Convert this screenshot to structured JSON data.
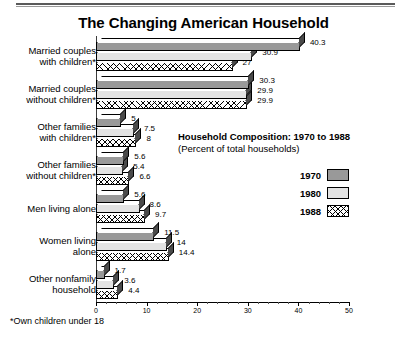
{
  "chart_data": {
    "type": "bar",
    "orientation": "horizontal",
    "title": "The Changing American Household",
    "subtitle_main": "Household Composition: 1970 to 1988",
    "subtitle_sub": "(Percent of total households)",
    "xlabel": "",
    "ylabel": "",
    "xlim": [
      0,
      50
    ],
    "xticks": [
      0,
      10,
      20,
      30,
      40,
      50
    ],
    "xtick_labels": [
      "0",
      "10",
      "20",
      "30",
      "40",
      "50"
    ],
    "minor_tick_step": 2,
    "grid": false,
    "legend_position": "inside-right",
    "categories": [
      "Married couples\nwith children*",
      "Married couples\nwithout children*",
      "Other families\nwith children*",
      "Other families\nwithout children*",
      "Men living alone",
      "Women living\nalone",
      "Other nonfamily\nhousehold"
    ],
    "series": [
      {
        "name": "1970",
        "color": "#999999",
        "values": [
          40.3,
          30.3,
          5,
          5.6,
          5.6,
          11.5,
          1.7
        ],
        "labels": [
          "40.3",
          "30.3",
          "5",
          "5.6",
          "5.6",
          "11.5",
          "1.7"
        ]
      },
      {
        "name": "1980",
        "color": "#e3e3e3",
        "values": [
          30.9,
          29.9,
          7.5,
          5.4,
          8.6,
          14,
          3.6
        ],
        "labels": [
          "30.9",
          "29.9",
          "7.5",
          "5.4",
          "8.6",
          "14",
          "3.6"
        ]
      },
      {
        "name": "1988",
        "color": "#ffffff",
        "pattern": "crosshatch",
        "values": [
          27,
          29.9,
          8,
          6.6,
          9.7,
          14.4,
          4.4
        ],
        "labels": [
          "27",
          "29.9",
          "8",
          "6.6",
          "9.7",
          "14.4",
          "4.4"
        ]
      }
    ],
    "footnote": "*Own children under 18"
  },
  "legend": {
    "items": [
      {
        "label": "1970"
      },
      {
        "label": "1980"
      },
      {
        "label": "1988"
      }
    ]
  }
}
